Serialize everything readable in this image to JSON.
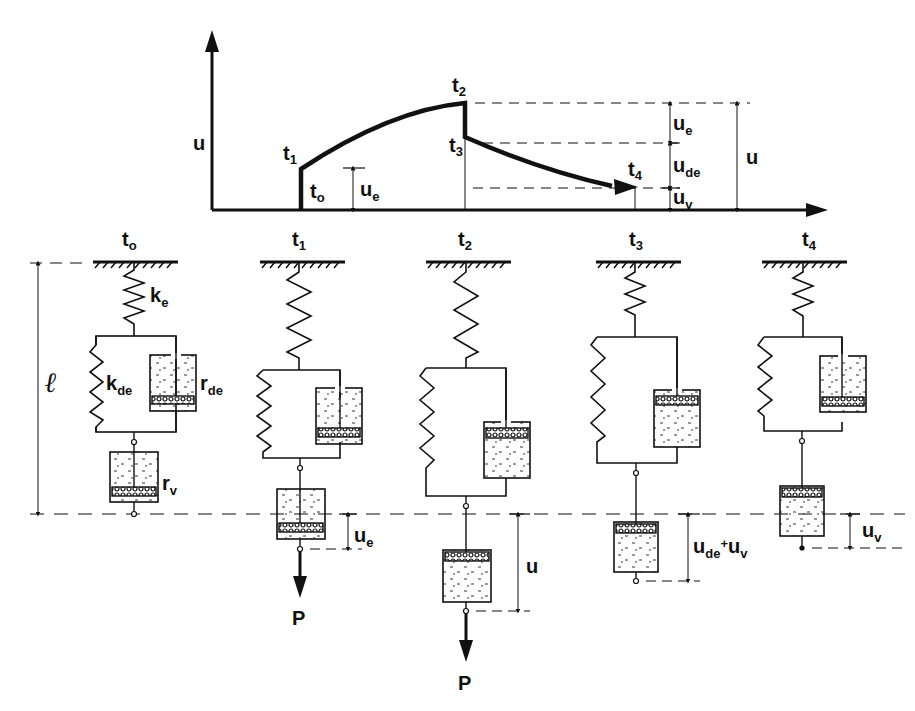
{
  "graph": {
    "y_axis_label": "u",
    "x_axis_label": "",
    "time_labels": {
      "t0": "t",
      "t0_sub": "o",
      "t1": "t",
      "t1_sub": "1",
      "t2": "t",
      "t2_sub": "2",
      "t3": "t",
      "t3_sub": "3",
      "t4": "t",
      "t4_sub": "4"
    },
    "ue_label": "u",
    "ue_sub": "e",
    "right_labels": {
      "ue": "u",
      "ue_sub": "e",
      "ude": "u",
      "ude_sub": "de",
      "uv": "u",
      "uv_sub": "v",
      "u_total": "u"
    }
  },
  "models": [
    {
      "time": "t",
      "time_sub": "o",
      "labels": {
        "ke": "k",
        "ke_sub": "e",
        "kde": "k",
        "kde_sub": "de",
        "rde": "r",
        "rde_sub": "de",
        "rv": "r",
        "rv_sub": "v",
        "length": "ℓ"
      }
    },
    {
      "time": "t",
      "time_sub": "1",
      "force": "P",
      "disp": "u",
      "disp_sub": "e"
    },
    {
      "time": "t",
      "time_sub": "2",
      "force": "P",
      "disp": "u",
      "disp_sub": ""
    },
    {
      "time": "t",
      "time_sub": "3",
      "disp": "u",
      "disp_sub": "de",
      "disp_plus": "+",
      "disp2": "u",
      "disp2_sub": "v"
    },
    {
      "time": "t",
      "time_sub": "4",
      "disp": "u",
      "disp_sub": "v"
    }
  ]
}
